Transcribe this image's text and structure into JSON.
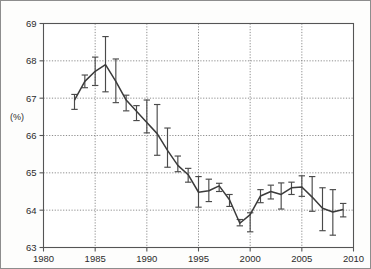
{
  "figure": {
    "title": "",
    "y_axis_unit_label": "(%)"
  },
  "chart_data": {
    "type": "line",
    "title": "",
    "subtitle": "",
    "xlabel": "",
    "ylabel": "(%)",
    "xlim": [
      1980,
      2010
    ],
    "ylim": [
      63,
      69
    ],
    "xticks": [
      1980,
      1985,
      1990,
      1995,
      2000,
      2005,
      2010
    ],
    "yticks": [
      63,
      64,
      65,
      66,
      67,
      68,
      69
    ],
    "xtick_labels": [
      "1980",
      "1985",
      "1990",
      "1995",
      "2000",
      "2005",
      "2010"
    ],
    "ytick_labels": [
      "63",
      "64",
      "65",
      "66",
      "67",
      "68",
      "69"
    ],
    "grid": true,
    "grid_style": "dotted",
    "legend": null,
    "legend_position": "none",
    "marker": "none",
    "error_bars": true,
    "error_bar_style": "capped-vertical",
    "line_color": "#3b3b3b",
    "errorbar_color": "#4a4a4a",
    "annotations": [],
    "x": [
      1983,
      1984,
      1985,
      1986,
      1987,
      1988,
      1989,
      1990,
      1991,
      1992,
      1993,
      1994,
      1995,
      1996,
      1997,
      1998,
      1999,
      2000,
      2001,
      2002,
      2003,
      2004,
      2005,
      2006,
      2007,
      2008,
      2009
    ],
    "values": [
      66.95,
      67.45,
      67.72,
      67.9,
      67.45,
      66.95,
      66.65,
      66.35,
      66.05,
      65.6,
      65.2,
      64.95,
      64.48,
      64.52,
      64.65,
      64.28,
      63.65,
      63.88,
      64.38,
      64.5,
      64.42,
      64.6,
      64.62,
      64.35,
      64.05,
      63.95,
      64.02
    ],
    "y_err_low": [
      66.7,
      67.28,
      67.34,
      67.17,
      66.88,
      66.66,
      66.4,
      66.07,
      65.47,
      65.15,
      65.03,
      64.75,
      64.08,
      64.23,
      64.5,
      64.1,
      63.58,
      63.42,
      64.2,
      64.3,
      64.03,
      64.42,
      64.37,
      63.97,
      63.45,
      63.33,
      63.82
    ],
    "y_err_high": [
      67.1,
      67.62,
      68.1,
      68.65,
      68.05,
      67.08,
      66.8,
      66.95,
      66.83,
      66.2,
      65.45,
      65.12,
      64.9,
      64.83,
      64.72,
      64.42,
      63.75,
      63.93,
      64.55,
      64.67,
      64.73,
      64.75,
      64.92,
      64.9,
      64.6,
      64.55,
      64.18
    ]
  }
}
